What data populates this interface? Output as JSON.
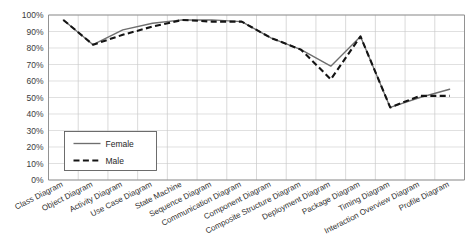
{
  "chart_data": {
    "type": "line",
    "title": "",
    "xlabel": "",
    "ylabel": "",
    "ylim": [
      0,
      100
    ],
    "grid": true,
    "legend_position": "inside-lower-left",
    "ytick_labels": [
      "100%",
      "90%",
      "80%",
      "70%",
      "60%",
      "50%",
      "40%",
      "30%",
      "20%",
      "10%",
      "0%"
    ],
    "ytick_values": [
      100,
      90,
      80,
      70,
      60,
      50,
      40,
      30,
      20,
      10,
      0
    ],
    "categories": [
      "Class Diagram",
      "Object Diagram",
      "Activity Diagram",
      "Use Case Diagram",
      "State Machine",
      "Sequence Diagram",
      "Communication Diagram",
      "Component Diagram",
      "Composite Structure Diagram",
      "Deployment Diagram",
      "Package Diagram",
      "Timing Diagram",
      "Interaction Overview Diagram",
      "Profile Diagram"
    ],
    "series": [
      {
        "name": "Female",
        "style": "solid",
        "color": "#6e6e6e",
        "values": [
          97,
          82,
          91,
          95,
          97,
          97,
          96,
          86,
          79,
          69,
          87,
          44,
          50,
          55
        ]
      },
      {
        "name": "Male",
        "style": "dashed",
        "color": "#141414",
        "values": [
          97,
          82,
          88,
          93,
          97,
          96,
          96,
          86,
          79,
          61,
          87,
          44,
          51,
          51
        ]
      }
    ]
  },
  "legend": {
    "entries": [
      {
        "label": "Female"
      },
      {
        "label": "Male"
      }
    ]
  }
}
